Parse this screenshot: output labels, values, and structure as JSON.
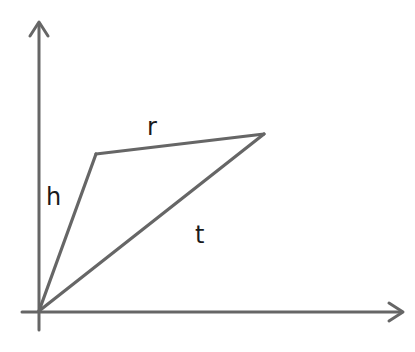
{
  "diagram": {
    "type": "vector-triangle-on-axes",
    "stroke_color": "#666666",
    "label_color": "#1a1a1a",
    "background": "#ffffff",
    "axes": {
      "origin": [
        39,
        312
      ],
      "y_axis_top": [
        39,
        22
      ],
      "x_axis_right": [
        403,
        312
      ]
    },
    "vertices": {
      "origin": [
        39,
        311
      ],
      "apex": [
        96,
        154
      ],
      "right": [
        264,
        134
      ]
    },
    "edges": [
      {
        "id": "h",
        "label": "h",
        "from": "origin",
        "to": "apex"
      },
      {
        "id": "r",
        "label": "r",
        "from": "apex",
        "to": "right"
      },
      {
        "id": "t",
        "label": "t",
        "from": "origin",
        "to": "right"
      }
    ],
    "labels": {
      "h": "h",
      "r": "r",
      "t": "t"
    }
  }
}
